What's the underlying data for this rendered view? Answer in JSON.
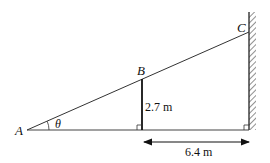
{
  "diagram": {
    "type": "geometry",
    "points": {
      "A": {
        "label": "A",
        "x": 27,
        "y": 130
      },
      "B": {
        "label": "B",
        "x": 142,
        "y": 79
      },
      "C": {
        "label": "C",
        "x": 249,
        "y": 32
      }
    },
    "angle": {
      "label": "θ",
      "at": "A"
    },
    "height_label": "2.7 m",
    "distance_label": "6.4 m",
    "colors": {
      "line": "#222222",
      "background": "#ffffff"
    }
  }
}
